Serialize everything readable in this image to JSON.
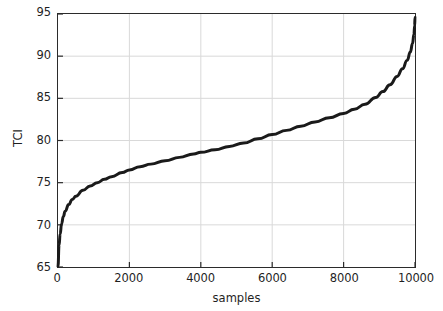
{
  "chart_data": {
    "type": "line",
    "title": "",
    "xlabel": "samples",
    "ylabel": "TCI",
    "xlim": [
      0,
      10000
    ],
    "ylim": [
      65,
      95
    ],
    "grid": true,
    "legend": null,
    "xticks": [
      0,
      2000,
      4000,
      6000,
      8000,
      10000
    ],
    "xtick_labels": [
      "0",
      "2000",
      "4000",
      "6000",
      "8000",
      "10000"
    ],
    "yticks": [
      65,
      70,
      75,
      80,
      85,
      90,
      95
    ],
    "ytick_labels": [
      "65",
      "70",
      "75",
      "80",
      "85",
      "90",
      "95"
    ],
    "line_color": "#1a1a1a",
    "line_width": 3,
    "grid_color": "#d9d9d9",
    "axis_color": "#2b2b2b",
    "background": "#ffffff",
    "series": [
      {
        "name": "TCI sorted samples",
        "x": [
          0,
          30,
          60,
          100,
          150,
          200,
          300,
          400,
          500,
          700,
          900,
          1100,
          1300,
          1500,
          1800,
          2000,
          2300,
          2600,
          3000,
          3400,
          3800,
          4000,
          4400,
          4800,
          5200,
          5600,
          6000,
          6400,
          6800,
          7200,
          7600,
          8000,
          8300,
          8600,
          8900,
          9100,
          9300,
          9500,
          9650,
          9780,
          9870,
          9930,
          9970,
          9990,
          10000
        ],
        "y": [
          65.1,
          67.6,
          68.9,
          70.1,
          71.0,
          71.6,
          72.4,
          73.0,
          73.4,
          74.1,
          74.6,
          75.0,
          75.4,
          75.7,
          76.2,
          76.5,
          76.9,
          77.2,
          77.6,
          78.0,
          78.4,
          78.6,
          78.9,
          79.3,
          79.7,
          80.2,
          80.7,
          81.2,
          81.7,
          82.2,
          82.7,
          83.2,
          83.7,
          84.3,
          85.1,
          85.8,
          86.6,
          87.6,
          88.5,
          89.5,
          90.5,
          91.5,
          92.6,
          93.6,
          94.6
        ]
      }
    ]
  },
  "axes": {
    "xlabel": "samples",
    "ylabel": "TCI"
  }
}
